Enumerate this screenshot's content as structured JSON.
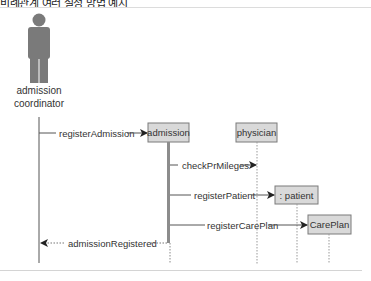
{
  "caption": "비례관계 여러 설정 방법 예시",
  "actor": {
    "label_line1": "admission",
    "label_line2": "coordinator",
    "icon": "person-icon",
    "color": "#7a7a7a"
  },
  "objects": [
    {
      "id": "admission",
      "label": "admission"
    },
    {
      "id": "physician",
      "label": "physician"
    },
    {
      "id": "patient",
      "label": ": patient"
    },
    {
      "id": "careplan",
      "label": "CarePlan"
    }
  ],
  "messages": [
    {
      "label": "registerAdmission",
      "from": "actor",
      "to": "admission",
      "type": "sync"
    },
    {
      "label": "checkPrMileges",
      "from": "admission",
      "to": "physician",
      "type": "sync"
    },
    {
      "label": "registerPatient",
      "from": "admission",
      "to": "patient",
      "type": "create"
    },
    {
      "label": "registerCarePlan",
      "from": "admission",
      "to": "careplan",
      "type": "create"
    },
    {
      "label": "admissionRegistered",
      "from": "admission",
      "to": "actor",
      "type": "return"
    }
  ],
  "colors": {
    "box_fill": "#d9d9d9",
    "box_stroke": "#7a7a7a",
    "line": "#555555",
    "activation": "#8c8c8c"
  }
}
